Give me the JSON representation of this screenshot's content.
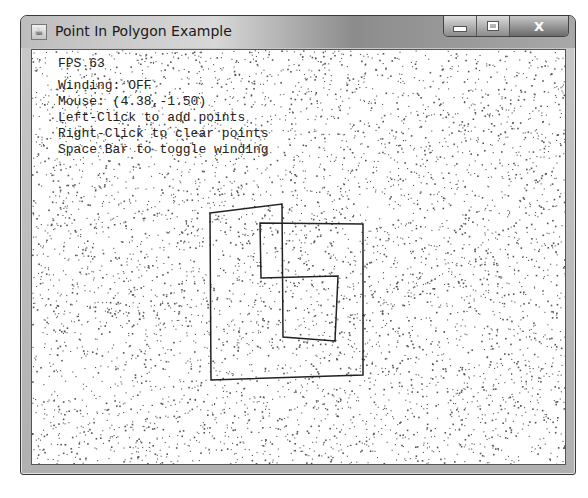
{
  "window": {
    "title": "Point In Polygon Example",
    "icon": "java-cup-icon",
    "controls": {
      "minimize": "minimize-icon",
      "maximize": "maximize-icon",
      "close": "X"
    }
  },
  "hud": {
    "fps": "FPS 63",
    "winding": "Winding: OFF",
    "mouse": "Mouse: (4.38,-1.50)",
    "help_left": "Left-Click to add points",
    "help_right": "Right-Click to clear points",
    "help_space": "Space Bar to toggle winding"
  },
  "polygon": {
    "stroke": "#222222",
    "points_screen": [
      [
        209,
        212
      ],
      [
        281,
        203
      ],
      [
        282,
        336
      ],
      [
        334,
        340
      ],
      [
        337,
        275
      ],
      [
        260,
        277
      ],
      [
        259,
        222
      ],
      [
        362,
        223
      ],
      [
        362,
        374
      ],
      [
        210,
        379
      ]
    ]
  }
}
